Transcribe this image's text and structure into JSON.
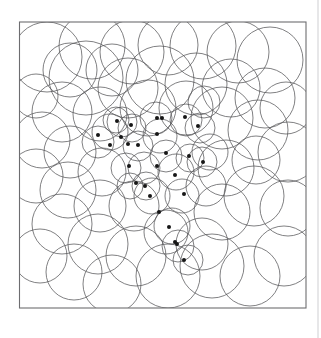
{
  "figure": {
    "kind": "scanned-geometric-diagram",
    "canvas": {
      "width": 321,
      "height": 338,
      "background": "#ffffff"
    },
    "frame": {
      "name": "plot-border",
      "x": 19.5,
      "y": 22.0,
      "width": 286.5,
      "height": 286.0,
      "stroke": "#6d6d70",
      "stroke_width": 1.1
    },
    "page_edge": {
      "name": "scan-page-edge",
      "x": 318.0,
      "y_top": 0,
      "y_bottom": 338,
      "stroke": "#cfcfd2"
    },
    "style": {
      "circle_stroke": "#555558",
      "circle_stroke_width": 0.75,
      "dot_fill": "#161616",
      "dot_radius": 2.0
    },
    "circles": [
      {
        "cx": 47,
        "cy": 57,
        "r": 35
      },
      {
        "cx": 92,
        "cy": 46,
        "r": 33
      },
      {
        "cx": 86,
        "cy": 78,
        "r": 37
      },
      {
        "cx": 132,
        "cy": 52,
        "r": 32
      },
      {
        "cx": 128,
        "cy": 88,
        "r": 30
      },
      {
        "cx": 168,
        "cy": 45,
        "r": 30
      },
      {
        "cx": 160,
        "cy": 80,
        "r": 34
      },
      {
        "cx": 203,
        "cy": 46,
        "r": 33
      },
      {
        "cx": 196,
        "cy": 84,
        "r": 31
      },
      {
        "cx": 238,
        "cy": 52,
        "r": 31
      },
      {
        "cx": 231,
        "cy": 88,
        "r": 29
      },
      {
        "cx": 270,
        "cy": 60,
        "r": 33
      },
      {
        "cx": 265,
        "cy": 98,
        "r": 30
      },
      {
        "cx": 36,
        "cy": 96,
        "r": 22
      },
      {
        "cx": 62,
        "cy": 112,
        "r": 30
      },
      {
        "cx": 100,
        "cy": 114,
        "r": 27
      },
      {
        "cx": 70,
        "cy": 70,
        "r": 27
      },
      {
        "cx": 112,
        "cy": 70,
        "r": 26
      },
      {
        "cx": 148,
        "cy": 108,
        "r": 28
      },
      {
        "cx": 186,
        "cy": 108,
        "r": 27
      },
      {
        "cx": 222,
        "cy": 118,
        "r": 31
      },
      {
        "cx": 258,
        "cy": 130,
        "r": 30
      },
      {
        "cx": 286,
        "cy": 108,
        "r": 26
      },
      {
        "cx": 288,
        "cy": 152,
        "r": 30
      },
      {
        "cx": 42,
        "cy": 140,
        "r": 28
      },
      {
        "cx": 36,
        "cy": 176,
        "r": 27
      },
      {
        "cx": 70,
        "cy": 152,
        "r": 26
      },
      {
        "cx": 68,
        "cy": 190,
        "r": 28
      },
      {
        "cx": 102,
        "cy": 172,
        "r": 24
      },
      {
        "cx": 100,
        "cy": 206,
        "r": 26
      },
      {
        "cx": 134,
        "cy": 206,
        "r": 25
      },
      {
        "cx": 62,
        "cy": 224,
        "r": 30
      },
      {
        "cx": 98,
        "cy": 244,
        "r": 30
      },
      {
        "cx": 40,
        "cy": 256,
        "r": 27
      },
      {
        "cx": 136,
        "cy": 256,
        "r": 30
      },
      {
        "cx": 74,
        "cy": 272,
        "r": 28
      },
      {
        "cx": 112,
        "cy": 284,
        "r": 29
      },
      {
        "cx": 168,
        "cy": 276,
        "r": 32
      },
      {
        "cx": 212,
        "cy": 266,
        "r": 32
      },
      {
        "cx": 250,
        "cy": 276,
        "r": 30
      },
      {
        "cx": 284,
        "cy": 256,
        "r": 30
      },
      {
        "cx": 288,
        "cy": 208,
        "r": 28
      },
      {
        "cx": 254,
        "cy": 196,
        "r": 30
      },
      {
        "cx": 222,
        "cy": 212,
        "r": 28
      },
      {
        "cx": 226,
        "cy": 168,
        "r": 28
      },
      {
        "cx": 256,
        "cy": 160,
        "r": 24
      },
      {
        "cx": 202,
        "cy": 244,
        "r": 26
      },
      {
        "cx": 166,
        "cy": 232,
        "r": 22
      },
      {
        "cx": 206,
        "cy": 186,
        "r": 20
      },
      {
        "cx": 176,
        "cy": 172,
        "r": 18
      },
      {
        "cx": 210,
        "cy": 152,
        "r": 18
      },
      {
        "cx": 110,
        "cy": 132,
        "r": 18
      },
      {
        "cx": 122,
        "cy": 122,
        "r": 15
      },
      {
        "cx": 138,
        "cy": 146,
        "r": 15
      },
      {
        "cx": 160,
        "cy": 136,
        "r": 17
      },
      {
        "cx": 186,
        "cy": 120,
        "r": 16
      },
      {
        "cx": 166,
        "cy": 156,
        "r": 16
      },
      {
        "cx": 144,
        "cy": 168,
        "r": 16
      },
      {
        "cx": 152,
        "cy": 196,
        "r": 18
      },
      {
        "cx": 182,
        "cy": 196,
        "r": 17
      },
      {
        "cx": 172,
        "cy": 226,
        "r": 18
      },
      {
        "cx": 178,
        "cy": 246,
        "r": 16
      },
      {
        "cx": 188,
        "cy": 260,
        "r": 15
      },
      {
        "cx": 126,
        "cy": 168,
        "r": 15
      },
      {
        "cx": 98,
        "cy": 142,
        "r": 16
      },
      {
        "cx": 116,
        "cy": 120,
        "r": 13
      },
      {
        "cx": 132,
        "cy": 128,
        "r": 14
      },
      {
        "cx": 200,
        "cy": 128,
        "r": 15
      },
      {
        "cx": 202,
        "cy": 162,
        "r": 15
      },
      {
        "cx": 156,
        "cy": 118,
        "r": 16
      },
      {
        "cx": 190,
        "cy": 158,
        "r": 14
      },
      {
        "cx": 146,
        "cy": 186,
        "r": 14
      },
      {
        "cx": 130,
        "cy": 186,
        "r": 13
      },
      {
        "cx": 204,
        "cy": 102,
        "r": 16
      }
    ],
    "dots": [
      {
        "cx": 117,
        "cy": 121
      },
      {
        "cx": 131,
        "cy": 125
      },
      {
        "cx": 157,
        "cy": 118
      },
      {
        "cx": 162,
        "cy": 118
      },
      {
        "cx": 185,
        "cy": 117
      },
      {
        "cx": 198,
        "cy": 126
      },
      {
        "cx": 98,
        "cy": 135
      },
      {
        "cx": 110,
        "cy": 145
      },
      {
        "cx": 121,
        "cy": 137
      },
      {
        "cx": 128,
        "cy": 144
      },
      {
        "cx": 138,
        "cy": 145
      },
      {
        "cx": 157,
        "cy": 134
      },
      {
        "cx": 166,
        "cy": 153
      },
      {
        "cx": 189,
        "cy": 156
      },
      {
        "cx": 203,
        "cy": 162
      },
      {
        "cx": 157,
        "cy": 166
      },
      {
        "cx": 129,
        "cy": 166
      },
      {
        "cx": 136,
        "cy": 183
      },
      {
        "cx": 145,
        "cy": 186
      },
      {
        "cx": 150,
        "cy": 196
      },
      {
        "cx": 175,
        "cy": 175
      },
      {
        "cx": 184,
        "cy": 194
      },
      {
        "cx": 159,
        "cy": 212
      },
      {
        "cx": 169,
        "cy": 227
      },
      {
        "cx": 175,
        "cy": 242
      },
      {
        "cx": 177,
        "cy": 244
      },
      {
        "cx": 184,
        "cy": 260
      }
    ]
  }
}
